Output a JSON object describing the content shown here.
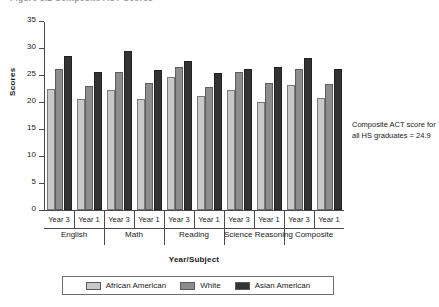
{
  "figure": {
    "title": "Figure 5.2  Composite ACT Scores",
    "annotation": "Composite ACT score for all HS graduates = 24.9"
  },
  "chart_data": {
    "type": "bar",
    "title": "Figure 5.2  Composite ACT Scores",
    "xlabel": "Year/Subject",
    "ylabel": "Scores",
    "ylim": [
      0,
      35
    ],
    "yticks": [
      0,
      5,
      10,
      15,
      20,
      25,
      30,
      35
    ],
    "grid": false,
    "legend_position": "bottom",
    "groups": [
      "English",
      "Math",
      "Reading",
      "Science Reasoning",
      "Composite"
    ],
    "subgroups": [
      "Year 3",
      "Year 1"
    ],
    "categories": [
      "English Year 3",
      "English Year 1",
      "Math Year 3",
      "Math Year 1",
      "Reading Year 3",
      "Reading Year 1",
      "Science Reasoning Year 3",
      "Science Reasoning Year 1",
      "Composite Year 3",
      "Composite Year 1"
    ],
    "series": [
      {
        "name": "African American",
        "color": "#c9c9c9",
        "values": [
          22.4,
          20.6,
          22.2,
          20.6,
          24.7,
          21.2,
          22.3,
          20.0,
          23.1,
          20.8
        ]
      },
      {
        "name": "White",
        "color": "#8d8d8d",
        "values": [
          26.1,
          22.9,
          25.5,
          23.6,
          26.5,
          22.8,
          25.5,
          23.5,
          26.1,
          23.4
        ]
      },
      {
        "name": "Asian American",
        "color": "#333333",
        "values": [
          28.6,
          25.6,
          29.4,
          25.9,
          27.6,
          25.4,
          26.1,
          26.4,
          28.2,
          26.1
        ]
      }
    ],
    "annotations": [
      {
        "text": "Composite ACT score for all HS graduates = 24.9"
      }
    ]
  }
}
